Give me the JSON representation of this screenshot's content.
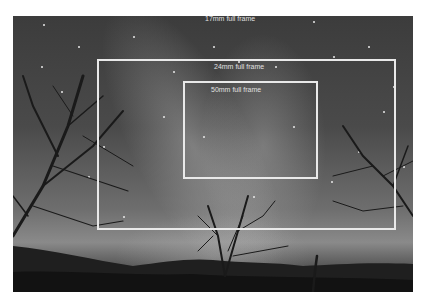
{
  "image": {
    "description": "Night sky photograph with Milky Way over silhouetted trees, overlaid with focal-length crop frames",
    "colors": {
      "frame_stroke": "#e9e9e9",
      "label_text": "#e0e0e0",
      "sky": "#4a4a4a",
      "background": "#ffffff"
    }
  },
  "frames": [
    {
      "label": "17mm full frame"
    },
    {
      "label": "24mm full frame"
    },
    {
      "label": "50mm full frame"
    }
  ]
}
